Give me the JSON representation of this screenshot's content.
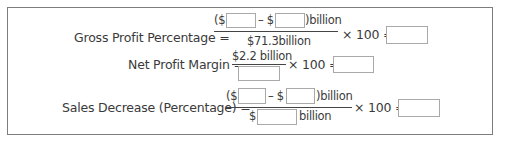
{
  "formulas": [
    {
      "label": "Gross Profit Percentage =",
      "numerator": {
        "open": "($",
        "minus": "– $",
        "close": ")billion"
      },
      "denominator": {
        "text": "$71.3billion"
      },
      "times": "× 100 =",
      "inputs": {
        "value_1": "",
        "value_2": "",
        "answer": ""
      }
    },
    {
      "label": "Net Profit Margin =",
      "numerator": {
        "text": "$2.2 billion"
      },
      "denominator": {
        "input": ""
      },
      "times": "× 100 =",
      "inputs": {
        "answer": ""
      }
    },
    {
      "label": "Sales Decrease (Percentage) =",
      "numerator": {
        "open": "($",
        "minus": "– $",
        "close": ")billion"
      },
      "denominator": {
        "prefix": "$",
        "suffix": "billion"
      },
      "times": "× 100 =",
      "inputs": {
        "value_1": "",
        "value_2": "",
        "denominator": "",
        "answer": ""
      }
    }
  ]
}
